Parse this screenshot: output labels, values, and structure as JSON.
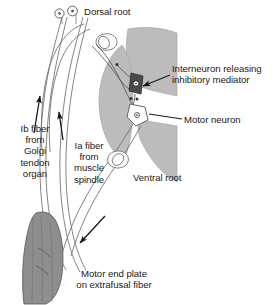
{
  "figure": {
    "width": 275,
    "height": 305
  },
  "labels": {
    "dorsal_root": "Dorsal root",
    "interneuron": "Interneuron releasing\ninhibitory mediator",
    "motor_neuron": "Motor neuron",
    "ib_fiber": "Ib fiber\nfrom\nGolgi\ntendon\norgan",
    "ia_fiber": "Ia fiber\nfrom\nmuscle\nspindle",
    "ventral_root": "Ventral root",
    "motor_end_plate": "Motor end plate\non extrafusal fiber"
  },
  "colors": {
    "background": "#ffffff",
    "outline": "#4a4a4a",
    "text": "#1a1a1a",
    "gray_matter": "#bcbcbc",
    "gray_matter_edge": "#9a9a9a",
    "interneuron_fill": "#4a4a4a",
    "motor_neuron_fill": "#fdfdfd",
    "muscle_fill": "#8e8e8e",
    "muscle_edge": "#5e5e5e",
    "nerve_fill": "#fafafa",
    "arrow": "#111111"
  },
  "structures": {
    "sensory_ganglion_cells": 2,
    "interneuron_shape": "dark-square-with-nucleus",
    "motor_neuron_shape": "light-polygon-with-nucleus",
    "arrows": [
      {
        "name": "ib-afferent-arrow",
        "direction": "up"
      },
      {
        "name": "ia-afferent-arrow",
        "direction": "up"
      },
      {
        "name": "efferent-arrow",
        "direction": "down-left"
      }
    ]
  }
}
